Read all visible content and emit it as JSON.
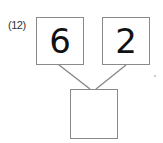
{
  "problem": {
    "number_label": "(12)",
    "top_left_value": "6",
    "top_right_value": "2",
    "bottom_value": ""
  },
  "colors": {
    "box_border": "#8a8a8a",
    "line": "#8a8a8a",
    "text": "#111111"
  }
}
